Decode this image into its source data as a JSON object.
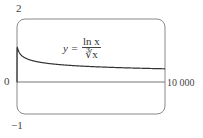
{
  "chart_data": {
    "type": "line",
    "title": "",
    "xlabel": "",
    "ylabel": "",
    "xlim": [
      0,
      10000
    ],
    "ylim": [
      -1,
      2
    ],
    "grid": false,
    "y_tick_labels": [
      "2",
      "0",
      "-1"
    ],
    "x_tick_labels": [
      "0",
      "10000"
    ],
    "annotation": "y = ln x / ∛x",
    "series": [
      {
        "name": "y = ln x / ∛x",
        "x": [
          1,
          5,
          20,
          100,
          500,
          1000,
          2000,
          4000,
          6000,
          8000,
          10000
        ],
        "y": [
          0.0,
          0.94,
          1.1,
          0.99,
          0.78,
          0.69,
          0.6,
          0.52,
          0.48,
          0.45,
          0.43
        ]
      }
    ]
  },
  "labels": {
    "y_top": "2",
    "y_zero": "0",
    "y_bottom": "−1",
    "x_right": "10 000",
    "formula_lhs": "y =",
    "formula_num": "ln x",
    "formula_den": "∛x"
  }
}
